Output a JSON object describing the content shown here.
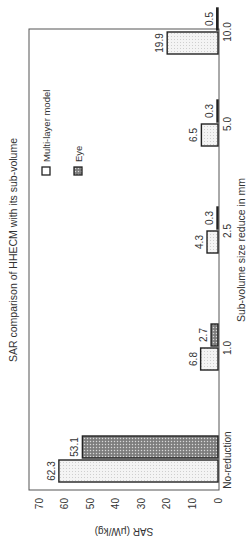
{
  "chart_data": {
    "type": "bar",
    "title": "SAR comparison of HHECM with its sub-volume",
    "xlabel": "Sub-volume size reduce in mm",
    "ylabel": "SAR (μW/kg)",
    "categories": [
      "No-reduction",
      "1.0",
      "2.5",
      "5.0",
      "10.0"
    ],
    "series": [
      {
        "name": "Multi-layer model",
        "values": [
          62.3,
          6.8,
          4.3,
          6.5,
          19.9
        ],
        "pattern": "light-dotted"
      },
      {
        "name": "Eye",
        "values": [
          53.1,
          2.7,
          0.3,
          0.3,
          0.5
        ],
        "pattern": "dark-crosshatch"
      }
    ],
    "yticks": [
      0,
      10,
      20,
      30,
      40,
      50,
      60,
      70
    ],
    "ylim": [
      0,
      74
    ],
    "grid": false,
    "legend_position": "upper right inside",
    "orientation": "rotated 90 degrees counterclockwise"
  }
}
